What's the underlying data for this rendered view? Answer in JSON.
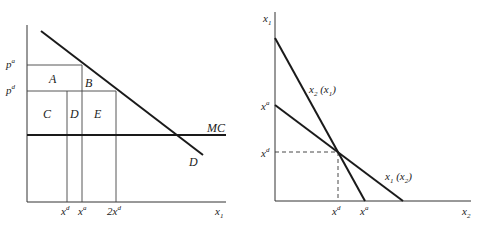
{
  "left_panel": {
    "y_labels": {
      "p_a": {
        "base": "p",
        "sup": "a"
      },
      "p_d": {
        "base": "p",
        "sup": "d"
      }
    },
    "region_labels": {
      "A": "A",
      "B": "B",
      "C": "C",
      "D_region": "D",
      "E": "E"
    },
    "curve_labels": {
      "MC": "MC",
      "demand": "D"
    },
    "x_labels": {
      "x_d": {
        "base": "x",
        "sup": "d"
      },
      "x_a": {
        "base": "x",
        "sup": "a"
      },
      "two_x_d": {
        "base": "2x",
        "sup": "d"
      },
      "axis": {
        "base": "x",
        "sub": "1"
      }
    }
  },
  "right_panel": {
    "y_axis_label": {
      "base": "x",
      "sub": "1"
    },
    "y_labels": {
      "x_a": {
        "base": "x",
        "sup": "a"
      },
      "x_d": {
        "base": "x",
        "sup": "d"
      }
    },
    "curve_labels": {
      "reaction_2": {
        "base": "x",
        "sub": "2",
        "arg": " (x",
        "argsub": "1",
        "close": ")"
      },
      "reaction_1": {
        "base": "x",
        "sub": "1",
        "arg": " (x",
        "argsub": "2",
        "close": ")"
      }
    },
    "x_labels": {
      "x_d": {
        "base": "x",
        "sup": "d"
      },
      "x_a": {
        "base": "x",
        "sup": "a"
      },
      "axis": {
        "base": "x",
        "sub": "2"
      }
    }
  },
  "colors": {
    "line": "#1a1a1a",
    "background": "#ffffff"
  }
}
